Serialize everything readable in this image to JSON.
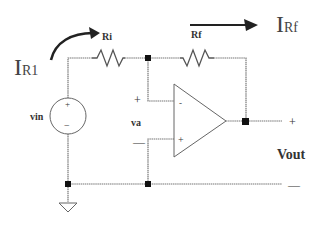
{
  "diagram": {
    "type": "inverting-op-amp-circuit",
    "labels": {
      "current_in": "I",
      "current_in_sub": "R1",
      "current_f": "I",
      "current_f_sub": "Rf",
      "resistor_in": "Ri",
      "resistor_f": "Rf",
      "source": "vin",
      "source_plus": "+",
      "source_minus": "−",
      "node_voltage": "va",
      "va_plus": "+",
      "va_minus": "—",
      "opamp_inverting": "-",
      "opamp_noninverting": "+",
      "output": "Vout",
      "output_plus": "+",
      "output_minus": "—"
    },
    "colors": {
      "wire": "#777777",
      "node": "#111111",
      "text": "#333333",
      "background": "#ffffff"
    }
  }
}
